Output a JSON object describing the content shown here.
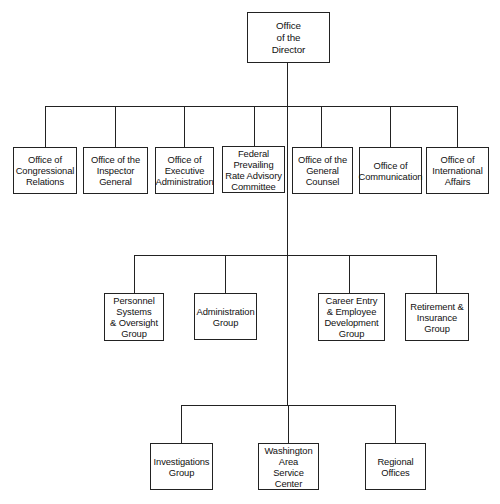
{
  "chart": {
    "type": "org-chart",
    "root": {
      "label": "Office\nof the\nDirector"
    },
    "level1": [
      {
        "label": "Office of\nCongressional\nRelations"
      },
      {
        "label": "Office of the\nInspector\nGeneral"
      },
      {
        "label": "Office of\nExecutive\nAdministration"
      },
      {
        "label": "Federal\nPrevailing\nRate Advisory\nCommittee"
      },
      {
        "label": "Office of the\nGeneral\nCounsel"
      },
      {
        "label": "Office of\nCommunication"
      },
      {
        "label": "Office of\nInternational\nAffairs"
      }
    ],
    "level2": [
      {
        "label": "Personnel\nSystems\n& Oversight\nGroup"
      },
      {
        "label": "Administration\nGroup"
      },
      {
        "label": "Career Entry\n& Employee\nDevelopment\nGroup"
      },
      {
        "label": "Retirement &\nInsurance\nGroup"
      }
    ],
    "level3": [
      {
        "label": "Investigations\nGroup"
      },
      {
        "label": "Washington\nArea\nService\nCenter"
      },
      {
        "label": "Regional\nOffices"
      }
    ]
  }
}
